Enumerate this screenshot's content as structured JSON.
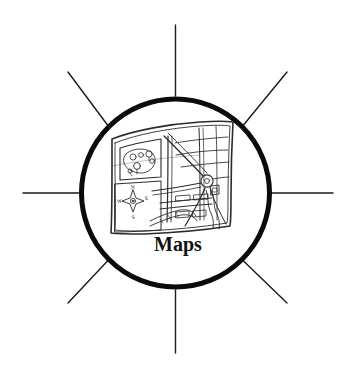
{
  "canvas": {
    "width": 356,
    "height": 373,
    "background_color": "#ffffff"
  },
  "icon": {
    "kind": "maps-badge",
    "style": "hand-drawn line art, black ink on white",
    "caption": "Maps",
    "caption_color": "#111111",
    "circle": {
      "name": "badge-circle",
      "center_x": 175.5,
      "center_y": 193,
      "radius": 94,
      "stroke_color": "#0b0b0b",
      "stroke_width": 5,
      "fill_color": "#ffffff"
    },
    "rays": {
      "name": "sun-rays",
      "count": 8,
      "stroke_color": "#1a1a1a",
      "stroke_width": 1.4,
      "inner_radius": 97,
      "outer_radius": 152,
      "angles_degrees": [
        0,
        45,
        90,
        135,
        180,
        225,
        270,
        315
      ],
      "directions": [
        "right",
        "up-right",
        "up",
        "up-left",
        "left",
        "down-left",
        "down",
        "down-right"
      ]
    }
  },
  "map_illustration": {
    "name": "street-map-drawing",
    "description": "folded paper street map drawn in perspective",
    "stroke_color": "#2b2b2b",
    "fill_color": "#ffffff",
    "features": [
      "park-with-trees",
      "street-grid",
      "diagonal-avenue",
      "roundabout",
      "river",
      "building-blocks",
      "compass-rose"
    ],
    "bounds": {
      "x": 110,
      "y": 120,
      "width": 124,
      "height": 114
    }
  },
  "compass": {
    "name": "compass-rose",
    "center_x": 133,
    "center_y": 200,
    "labels": {
      "north": "N",
      "west": "W",
      "east": "E",
      "south": "S"
    }
  }
}
